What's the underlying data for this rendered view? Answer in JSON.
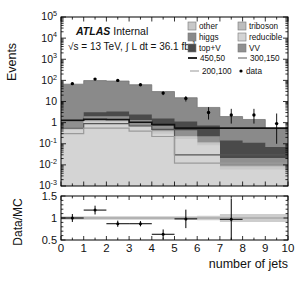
{
  "figure": {
    "kind": "atlas-stacked-histogram-with-ratio",
    "experiment_label": "ATLAS",
    "status_label": "Internal",
    "lumi_label": "√s = 13 TeV, ∫ L dt = 36.1 fb⁻¹",
    "lumi_parts": {
      "sqrt_s": "√s = 13 TeV,",
      "integral": "∫",
      "lumi": "L dt = 36.1 fb",
      "exponent": "-1"
    }
  },
  "chart_data": {
    "type": "bar",
    "title": "",
    "subtitle": "ATLAS Internal",
    "xlabel": "number of jets",
    "ylabel": "Events",
    "ratio_ylabel": "Data/MC",
    "xlim": [
      0,
      10
    ],
    "ylim": [
      0.001,
      100000
    ],
    "yscale": "log",
    "ratio_ylim": [
      0.5,
      1.5
    ],
    "grid": false,
    "legend_position": "upper-right",
    "xticks": [
      "0",
      "1",
      "2",
      "3",
      "4",
      "5",
      "6",
      "7",
      "8",
      "9",
      "10"
    ],
    "xtick_values": [
      0,
      1,
      2,
      3,
      4,
      5,
      6,
      7,
      8,
      9,
      10
    ],
    "yticks": [
      "10^5",
      "10^4",
      "10^3",
      "10^2",
      "10",
      "1",
      "10^-1",
      "10^-2",
      "10^-3"
    ],
    "ytick_values": [
      100000,
      10000,
      1000,
      100,
      10,
      1,
      0.1,
      0.01,
      0.001
    ],
    "ytick_labels": [
      {
        "mantissa": "10",
        "exp": "5"
      },
      {
        "mantissa": "10",
        "exp": "4"
      },
      {
        "mantissa": "10",
        "exp": "3"
      },
      {
        "mantissa": "10",
        "exp": "2"
      },
      {
        "mantissa": "10",
        "exp": ""
      },
      {
        "mantissa": "1",
        "exp": ""
      },
      {
        "mantissa": "10",
        "exp": "-1"
      },
      {
        "mantissa": "10",
        "exp": "-2"
      },
      {
        "mantissa": "10",
        "exp": "-3"
      }
    ],
    "ratio_yticks": [
      "1.5",
      "1",
      "0.5"
    ],
    "ratio_ytick_values": [
      1.5,
      1.0,
      0.5
    ],
    "bin_edges": [
      0,
      1,
      2,
      3,
      4,
      5,
      6,
      7,
      8,
      9,
      10
    ],
    "categories": [
      "0",
      "1",
      "2",
      "3",
      "4",
      "5",
      "6",
      "7",
      "8",
      "9"
    ],
    "series": [
      {
        "name": "reducible",
        "color": "#d4d4d4",
        "values": [
          0.45,
          1.05,
          1.05,
          0.62,
          0.3,
          0.17,
          0.085,
          0.006,
          0.006,
          0.006
        ]
      },
      {
        "name": "other",
        "color": "#c8c8c8",
        "values": [
          0.1,
          0.12,
          0.12,
          0.1,
          0.07,
          0.04,
          0.02,
          0.002,
          0.002,
          0.002
        ]
      },
      {
        "name": "triboson",
        "color": "#bdbdbd",
        "values": [
          0.05,
          0.06,
          0.06,
          0.05,
          0.04,
          0.02,
          0.012,
          0.001,
          0.001,
          0.001
        ]
      },
      {
        "name": "VV",
        "color": "#909090",
        "values": [
          0.55,
          0.8,
          0.8,
          0.55,
          0.32,
          0.2,
          0.11,
          0.012,
          0.012,
          0.012
        ]
      },
      {
        "name": "top+V",
        "color": "#4a4a4a",
        "values": [
          0.04,
          1.1,
          1.3,
          1.1,
          0.85,
          0.7,
          0.5,
          0.12,
          0.09,
          0.05
        ]
      },
      {
        "name": "higgs",
        "color": "#8a8a8a",
        "values": [
          65,
          95,
          90,
          60,
          28,
          14,
          4.5,
          1.8,
          1.3,
          0.45
        ]
      }
    ],
    "signal_lines": [
      {
        "name": "450,50",
        "color": "#111111",
        "width": 1.6,
        "values": [
          1.3,
          1.45,
          1.4,
          1.05,
          0.8,
          0.55,
          0.55,
          0.55,
          0.55,
          0.55
        ]
      },
      {
        "name": "300,150",
        "color": "#555555",
        "width": 1.2,
        "values": [
          0.55,
          0.9,
          0.9,
          0.7,
          0.48,
          0.03,
          0.03,
          0.03,
          0.03,
          0.03
        ]
      },
      {
        "name": "200,100",
        "color": "#9a9a9a",
        "width": 1.2,
        "values": [
          0.3,
          0.55,
          0.55,
          0.4,
          0.22,
          0.012,
          0.012,
          0.012,
          0.012,
          0.012
        ]
      }
    ],
    "data_points": {
      "name": "data",
      "color": "#000000",
      "x": [
        0.5,
        1.5,
        2.5,
        3.5,
        4.5,
        5.5,
        6.5,
        7.5,
        8.5,
        9.5
      ],
      "y": [
        70,
        115,
        100,
        62,
        25,
        14,
        3.0,
        2.3,
        2.3,
        0.9
      ],
      "yerr_low": [
        8,
        11,
        10,
        8,
        5,
        4,
        1.6,
        1.4,
        1.4,
        0.8
      ],
      "yerr_high": [
        8,
        11,
        10,
        8,
        5,
        4,
        2.4,
        2.2,
        2.2,
        1.8
      ],
      "visible": [
        true,
        true,
        true,
        true,
        true,
        true,
        true,
        true,
        true,
        true
      ]
    },
    "ratio_points": {
      "x": [
        0.5,
        1.5,
        2.5,
        3.5,
        4.5,
        5.5,
        7.5
      ],
      "y": [
        1.0,
        1.18,
        0.87,
        0.87,
        0.63,
        0.98,
        0.97
      ],
      "xerr": [
        0.5,
        0.5,
        0.5,
        0.5,
        0.5,
        0.5,
        0.5
      ],
      "yerr": [
        0.09,
        0.1,
        0.07,
        0.06,
        0.11,
        0.21,
        0.47
      ]
    },
    "ratio_band": {
      "color": "#cdcdcd",
      "nominal": 1.0,
      "rel_err": [
        0.04,
        0.04,
        0.04,
        0.04,
        0.04,
        0.04,
        0.05,
        0.09,
        0.09,
        0.09
      ]
    }
  },
  "legend": {
    "entries": [
      {
        "label": "other",
        "type": "box",
        "color": "#c8c8c8"
      },
      {
        "label": "triboson",
        "type": "box",
        "color": "#bdbdbd"
      },
      {
        "label": "higgs",
        "type": "box",
        "color": "#8a8a8a"
      },
      {
        "label": "reducible",
        "type": "box",
        "color": "#d4d4d4"
      },
      {
        "label": "top+V",
        "type": "box",
        "color": "#4a4a4a"
      },
      {
        "label": "VV",
        "type": "box",
        "color": "#909090"
      },
      {
        "label": "450,50",
        "type": "line",
        "color": "#111111"
      },
      {
        "label": "300,150",
        "type": "line",
        "color": "#666666"
      },
      {
        "label": "200,100",
        "type": "line",
        "color": "#a0a0a0"
      },
      {
        "label": "data",
        "type": "marker",
        "color": "#000000"
      }
    ]
  },
  "colors": {
    "frame": "#000000",
    "background": "#ffffff",
    "band": "#cdcdcd"
  }
}
